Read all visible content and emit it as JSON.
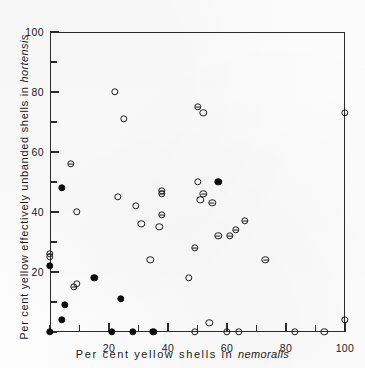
{
  "chart_data": {
    "type": "scatter",
    "title": "",
    "xlabel": "Per cent yellow shells in nemoralis",
    "ylabel": "Per cent yellow effectively unbanded shells in hortensis",
    "xlabel_plain": "Per cent yellow shells in ",
    "xlabel_italic": "nemoralis",
    "ylabel_plain": "Per cent yellow effectively unbanded shells in ",
    "ylabel_italic": "hortensis",
    "xlim": [
      0,
      100
    ],
    "ylim": [
      0,
      100
    ],
    "xticks": [
      0,
      10,
      20,
      30,
      40,
      50,
      60,
      70,
      80,
      90,
      100
    ],
    "yticks": [
      0,
      10,
      20,
      30,
      40,
      50,
      60,
      70,
      80,
      90,
      100
    ],
    "xtick_labels": [
      "20",
      "40",
      "60",
      "80",
      "100"
    ],
    "xtick_label_values": [
      20,
      40,
      60,
      80,
      100
    ],
    "ytick_labels": [
      "20",
      "40",
      "60",
      "80",
      "100"
    ],
    "ytick_label_values": [
      20,
      40,
      60,
      80,
      100
    ],
    "grid": false,
    "legend": "none",
    "marker_types": [
      "open",
      "barred",
      "filled"
    ],
    "axis_color": "#2b2b2b",
    "marker_color": "#1b1b1b",
    "background_color": "#fdfdfd",
    "series": [
      {
        "name": "open-circle",
        "marker": "open",
        "points": [
          [
            22,
            80
          ],
          [
            25,
            71
          ],
          [
            52,
            73
          ],
          [
            100,
            73
          ],
          [
            23,
            45
          ],
          [
            29,
            42
          ],
          [
            31,
            36
          ],
          [
            37,
            35
          ],
          [
            50,
            50
          ],
          [
            51,
            44
          ],
          [
            47,
            18
          ],
          [
            9,
            40
          ],
          [
            34,
            24
          ],
          [
            9,
            16
          ],
          [
            54,
            3
          ],
          [
            100,
            4
          ],
          [
            49,
            0
          ],
          [
            60,
            0
          ],
          [
            64,
            0
          ],
          [
            83,
            0
          ],
          [
            93,
            0
          ],
          [
            0,
            25
          ]
        ]
      },
      {
        "name": "barred-circle",
        "marker": "barred",
        "points": [
          [
            50,
            75
          ],
          [
            7,
            56
          ],
          [
            38,
            47
          ],
          [
            38,
            46
          ],
          [
            38,
            39
          ],
          [
            52,
            46
          ],
          [
            55,
            43
          ],
          [
            57,
            32
          ],
          [
            61,
            32
          ],
          [
            66,
            37
          ],
          [
            63,
            34
          ],
          [
            49,
            28
          ],
          [
            73,
            24
          ],
          [
            8,
            15
          ],
          [
            0,
            26
          ]
        ]
      },
      {
        "name": "filled-circle",
        "marker": "filled",
        "points": [
          [
            57,
            50
          ],
          [
            4,
            48
          ],
          [
            0,
            22
          ],
          [
            15,
            18
          ],
          [
            24,
            11
          ],
          [
            5,
            9
          ],
          [
            4,
            4
          ],
          [
            0,
            0
          ],
          [
            21,
            0
          ],
          [
            28,
            0
          ],
          [
            35,
            0
          ]
        ]
      }
    ]
  }
}
